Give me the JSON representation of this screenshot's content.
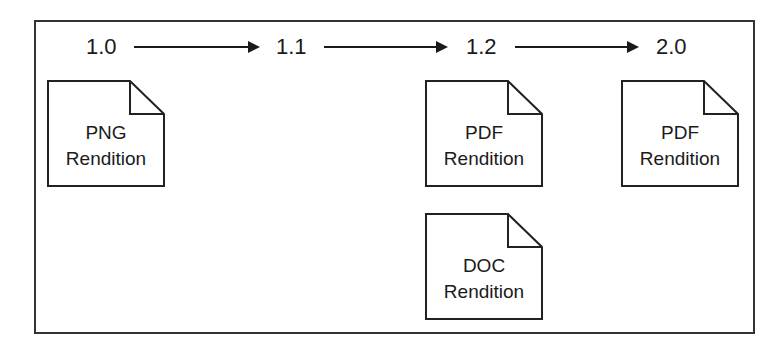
{
  "diagram": {
    "type": "version-history",
    "versions": [
      {
        "label": "1.0"
      },
      {
        "label": "1.1"
      },
      {
        "label": "1.2"
      },
      {
        "label": "2.0"
      }
    ],
    "renditions": [
      {
        "version": "1.0",
        "format": "PNG",
        "word": "Rendition"
      },
      {
        "version": "1.2",
        "format": "PDF",
        "word": "Rendition"
      },
      {
        "version": "1.2",
        "format": "DOC",
        "word": "Rendition"
      },
      {
        "version": "2.0",
        "format": "PDF",
        "word": "Rendition"
      }
    ],
    "colors": {
      "line": "#1a1a1a",
      "border": "#333333",
      "background": "#ffffff"
    }
  }
}
